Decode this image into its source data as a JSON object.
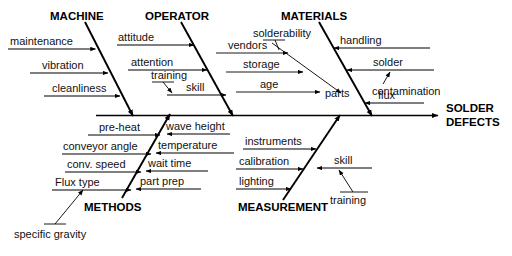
{
  "diagram": {
    "type": "fishbone-ishikawa",
    "effect": {
      "line1": "SOLDER",
      "line2": "DEFECTS"
    },
    "categories": [
      {
        "id": "machine",
        "label": "MACHINE",
        "position": "upper-left",
        "causes": [
          "maintenance",
          "vibration",
          "cleanliness"
        ]
      },
      {
        "id": "operator",
        "label": "OPERATOR",
        "position": "upper-middle",
        "causes": [
          "attitude",
          "attention",
          "skill"
        ],
        "sub_causes": [
          {
            "label": "training",
            "attaches_to": "skill"
          }
        ]
      },
      {
        "id": "materials",
        "label": "MATERIALS",
        "position": "upper-right",
        "causes": [
          "handling",
          "solder",
          "flux",
          "parts"
        ],
        "sub_causes": [
          {
            "label": "contamination",
            "attaches_to": "solder"
          },
          {
            "label": "vendors",
            "attaches_to": "parts"
          },
          {
            "label": "storage",
            "attaches_to": "parts"
          },
          {
            "label": "age",
            "attaches_to": "parts"
          },
          {
            "label": "solderability",
            "attaches_to": "parts"
          }
        ]
      },
      {
        "id": "methods",
        "label": "METHODS",
        "position": "lower-left",
        "causes": [
          "pre-heat",
          "conveyor angle",
          "conv. speed",
          "Flux type",
          "wave height",
          "temperature",
          "wait time",
          "part prep"
        ],
        "sub_causes": [
          {
            "label": "specific gravity",
            "attaches_to": "Flux type"
          }
        ]
      },
      {
        "id": "measurement",
        "label": "MEASUREMENT",
        "position": "lower-right",
        "causes": [
          "instruments",
          "calibration",
          "lighting",
          "skill"
        ],
        "sub_causes": [
          {
            "label": "training",
            "attaches_to": "skill"
          }
        ]
      }
    ],
    "labels": {
      "machine": "MACHINE",
      "operator": "OPERATOR",
      "materials": "MATERIALS",
      "methods": "METHODS",
      "measurement": "MEASUREMENT",
      "maintenance": "maintenance",
      "vibration": "vibration",
      "cleanliness": "cleanliness",
      "attitude": "attitude",
      "attention": "attention",
      "training_op": "training",
      "skill_op": "skill",
      "solderability": "solderability",
      "vendors": "vendors",
      "storage": "storage",
      "age": "age",
      "parts": "parts",
      "handling": "handling",
      "solder": "solder",
      "contamination": "contamination",
      "flux": "flux",
      "preheat": "pre-heat",
      "conveyor_angle": "conveyor angle",
      "conv_speed": "conv. speed",
      "flux_type": "Flux type",
      "wave_height": "wave height",
      "temperature": "temperature",
      "wait_time": "wait time",
      "part_prep": "part prep",
      "specific_gravity": "specific gravity",
      "instruments": "instruments",
      "calibration": "calibration",
      "lighting": "lighting",
      "skill_ms": "skill",
      "training_ms": "training"
    },
    "colors": {
      "ink": "#000000",
      "background": "#ffffff"
    }
  }
}
